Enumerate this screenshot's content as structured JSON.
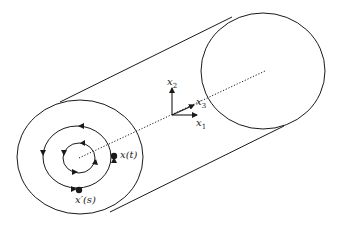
{
  "diagram": {
    "axes": {
      "x1": {
        "base": "x",
        "sub": "1"
      },
      "x2": {
        "base": "x",
        "sub": "2"
      },
      "x3": {
        "base": "x",
        "sub": "3"
      }
    },
    "points": {
      "x_t": "x(t)",
      "x_s": "x′(s)"
    },
    "colors": {
      "stroke": "#1a1a1a",
      "background": "#ffffff"
    }
  }
}
